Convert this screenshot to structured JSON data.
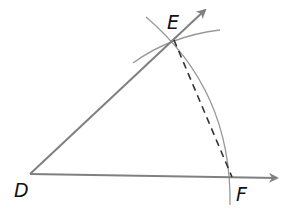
{
  "diagram": {
    "points": {
      "D": {
        "label": "D",
        "x": 30,
        "y": 174
      },
      "E": {
        "label": "E",
        "x": 174,
        "y": 40
      },
      "F": {
        "label": "F",
        "x": 232,
        "y": 177
      }
    },
    "segments": [
      {
        "from": "D",
        "to": "E",
        "style": "solid ray"
      },
      {
        "from": "D",
        "to": "F",
        "style": "solid ray"
      },
      {
        "from": "E",
        "to": "F",
        "style": "dashed"
      }
    ],
    "arcs": [
      {
        "name": "large arc through E and F"
      },
      {
        "name": "small arc through E"
      }
    ],
    "colors": {
      "line": "#808080",
      "arc": "#999999",
      "dashed": "#333333",
      "label": "#111111"
    }
  }
}
